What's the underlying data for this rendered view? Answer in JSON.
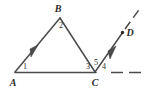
{
  "figure": {
    "type": "geometry-diagram",
    "background_color": "#ffffff",
    "stroke_color": "#4a4a4a",
    "label_color": "#2b2b2b",
    "width": 146,
    "height": 91
  },
  "points": [
    {
      "id": "A",
      "label": "A",
      "x": 15,
      "y": 72,
      "label_x": 13,
      "label_y": 83
    },
    {
      "id": "B",
      "label": "B",
      "x": 60,
      "y": 18,
      "label_x": 58,
      "label_y": 9
    },
    {
      "id": "C",
      "label": "C",
      "x": 95,
      "y": 72,
      "label_x": 95,
      "label_y": 83
    },
    {
      "id": "D",
      "label": "D",
      "x": 122,
      "y": 33,
      "label_x": 130,
      "label_y": 33
    }
  ],
  "angles": [
    {
      "id": "1",
      "label": "1",
      "vertex": "A",
      "x": 25,
      "y": 67
    },
    {
      "id": "2",
      "label": "2",
      "vertex": "B",
      "x": 61,
      "y": 26
    },
    {
      "id": "3",
      "label": "3",
      "vertex": "C",
      "x": 88,
      "y": 67
    },
    {
      "id": "5",
      "label": "5",
      "vertex": "C",
      "x": 96,
      "y": 63
    },
    {
      "id": "4",
      "label": "4",
      "vertex": "C",
      "x": 104,
      "y": 67
    }
  ],
  "segments": [
    {
      "id": "AB",
      "from": "A",
      "to": "B",
      "style": "solid",
      "arrow_mark": "single"
    },
    {
      "id": "BC",
      "from": "B",
      "to": "C",
      "style": "solid",
      "arrow_mark": "none"
    },
    {
      "id": "AC",
      "from": "A",
      "to": "C",
      "style": "solid",
      "arrow_mark": "none"
    },
    {
      "id": "C-dashed-right",
      "from": "C",
      "to": "edge-right",
      "style": "dashed",
      "arrow_mark": "none"
    },
    {
      "id": "CD",
      "from": "C",
      "to": "D",
      "style": "solid",
      "arrow_mark": "single"
    },
    {
      "id": "D-dashed-up",
      "from": "D",
      "to": "edge-top-right",
      "style": "dashed",
      "arrow_mark": "none"
    }
  ]
}
